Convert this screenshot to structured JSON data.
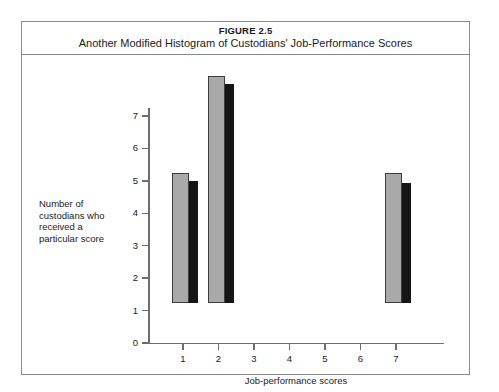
{
  "figure": {
    "number": "FIGURE 2.5",
    "title": "Another Modified Histogram of Custodians' Job-Performance Scores"
  },
  "axis_label_y": "Number of custodians who received a particular score",
  "axis_label_x": "Job-performance scores",
  "colors": {
    "bar_face": "#a9a9a9",
    "bar_shadow": "#151515",
    "bar_outline": "#3d3d3d",
    "axis": "#6e6e6e",
    "frame": "#8a8a8a",
    "text": "#1a1a1a"
  },
  "chart_data": {
    "type": "bar",
    "title": "Another Modified Histogram of Custodians' Job-Performance Scores",
    "xlabel": "Job-performance scores",
    "ylabel": "Number of custodians who received a particular score",
    "categories": [
      "1",
      "2",
      "3",
      "4",
      "5",
      "6",
      "7"
    ],
    "values": [
      4,
      7,
      0,
      0,
      0,
      0,
      4
    ],
    "shadow_values": [
      3.75,
      6.75,
      0,
      0,
      0,
      0,
      3.7
    ],
    "ylim": [
      0,
      7
    ],
    "yticks": [
      0,
      1,
      2,
      3,
      4,
      5,
      6,
      7
    ],
    "ytick_labels": [
      "0",
      "1",
      "2",
      "3",
      "4",
      "5",
      "6",
      "7"
    ],
    "xticks": [
      1,
      2,
      3,
      4,
      5,
      6,
      7
    ],
    "xtick_labels": [
      "1",
      "2",
      "3",
      "4",
      "5",
      "6",
      "7"
    ],
    "grid": false,
    "legend": null,
    "style": "3d-shadow-bars"
  }
}
